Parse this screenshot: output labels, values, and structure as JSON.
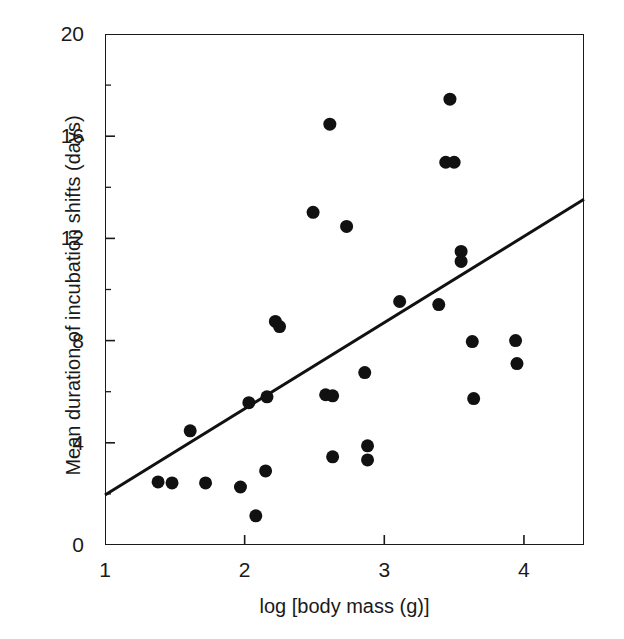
{
  "chart_data": {
    "type": "scatter",
    "title": "",
    "xlabel": "log [body mass (g)]",
    "ylabel": "Mean duration of incubation shifts (days)",
    "xlim": [
      1,
      4.43
    ],
    "ylim": [
      0,
      20
    ],
    "xticks": [
      1,
      2,
      3,
      4
    ],
    "xtick_labels": [
      "1",
      "2",
      "3",
      "4"
    ],
    "yticks": [
      0,
      4,
      8,
      12,
      16,
      20
    ],
    "ytick_labels": [
      "0",
      "4",
      "8",
      "12",
      "16",
      "20"
    ],
    "y_minor_ticks": [
      2,
      6,
      10,
      14,
      18
    ],
    "grid": false,
    "legend": null,
    "marker": "filled-circle",
    "marker_color": "#111111",
    "marker_size_px": 13,
    "points": [
      [
        1.38,
        2.47
      ],
      [
        1.48,
        2.43
      ],
      [
        1.61,
        4.47
      ],
      [
        1.72,
        2.43
      ],
      [
        1.97,
        2.27
      ],
      [
        2.03,
        5.57
      ],
      [
        2.08,
        1.14
      ],
      [
        2.15,
        2.9
      ],
      [
        2.16,
        5.8
      ],
      [
        2.22,
        8.75
      ],
      [
        2.25,
        8.55
      ],
      [
        2.49,
        13.02
      ],
      [
        2.58,
        5.88
      ],
      [
        2.61,
        16.47
      ],
      [
        2.63,
        5.84
      ],
      [
        2.63,
        3.45
      ],
      [
        2.73,
        12.47
      ],
      [
        2.86,
        6.75
      ],
      [
        2.88,
        3.88
      ],
      [
        2.88,
        3.33
      ],
      [
        3.11,
        9.53
      ],
      [
        3.39,
        9.41
      ],
      [
        3.44,
        14.98
      ],
      [
        3.47,
        17.45
      ],
      [
        3.5,
        14.98
      ],
      [
        3.55,
        11.49
      ],
      [
        3.55,
        11.1
      ],
      [
        3.63,
        7.96
      ],
      [
        3.64,
        5.73
      ],
      [
        3.94,
        8.0
      ],
      [
        3.95,
        7.1
      ]
    ],
    "n_points": 31,
    "trendline": {
      "type": "linear-regression",
      "color": "#111111",
      "width_px": 3,
      "x_start": 1.0,
      "y_start": 1.96,
      "x_end": 4.43,
      "y_end": 13.53
    },
    "axis_color": "#1a1a1a",
    "background_color": "#ffffff"
  }
}
